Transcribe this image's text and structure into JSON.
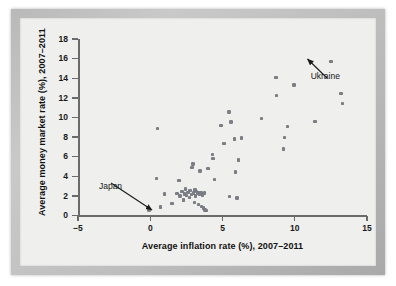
{
  "chart_data": {
    "type": "scatter",
    "title": "",
    "xlabel": "Average inflation rate (%), 2007–2011",
    "ylabel": "Average money market rate (%), 2007–2011",
    "xlim": [
      -5,
      15
    ],
    "ylim": [
      0,
      18
    ],
    "xticks": [
      -5,
      0,
      5,
      10,
      15
    ],
    "xtick_labels": [
      "−5",
      "0",
      "5",
      "10",
      "15"
    ],
    "yticks": [
      0,
      2,
      4,
      6,
      8,
      10,
      12,
      14,
      16,
      18
    ],
    "ytick_labels": [
      "0",
      "2",
      "4",
      "6",
      "8",
      "10",
      "12",
      "14",
      "16",
      "18"
    ],
    "grid": false,
    "legend": null,
    "marker_color": "#7c7f86",
    "axis_color": "#6b6b6b",
    "background_color": "#efefed",
    "points": [
      [
        -0.1,
        0.55
      ],
      [
        0.5,
        8.9
      ],
      [
        0.45,
        3.8
      ],
      [
        0.7,
        0.85
      ],
      [
        1.0,
        2.2
      ],
      [
        1.5,
        1.2
      ],
      [
        2.0,
        3.55
      ],
      [
        1.85,
        2.25
      ],
      [
        2.05,
        2.0
      ],
      [
        2.2,
        2.45
      ],
      [
        2.3,
        1.6
      ],
      [
        2.35,
        2.2
      ],
      [
        2.45,
        2.7
      ],
      [
        2.5,
        2.05
      ],
      [
        2.6,
        2.35
      ],
      [
        2.7,
        1.85
      ],
      [
        2.75,
        2.55
      ],
      [
        2.85,
        2.15
      ],
      [
        2.9,
        4.9
      ],
      [
        2.95,
        5.25
      ],
      [
        3.0,
        2.3
      ],
      [
        3.05,
        1.35
      ],
      [
        3.1,
        2.6
      ],
      [
        3.15,
        2.0
      ],
      [
        3.2,
        2.45
      ],
      [
        3.3,
        2.3
      ],
      [
        3.35,
        1.1
      ],
      [
        3.4,
        2.2
      ],
      [
        3.45,
        4.55
      ],
      [
        3.5,
        2.35
      ],
      [
        3.55,
        0.9
      ],
      [
        3.6,
        2.1
      ],
      [
        3.7,
        0.75
      ],
      [
        3.75,
        2.3
      ],
      [
        3.8,
        0.55
      ],
      [
        3.9,
        0.5
      ],
      [
        4.0,
        4.8
      ],
      [
        4.3,
        6.25
      ],
      [
        4.35,
        5.8
      ],
      [
        4.45,
        3.7
      ],
      [
        4.9,
        9.2
      ],
      [
        5.1,
        7.35
      ],
      [
        5.45,
        10.55
      ],
      [
        5.5,
        1.95
      ],
      [
        5.6,
        9.55
      ],
      [
        5.85,
        7.8
      ],
      [
        5.9,
        4.45
      ],
      [
        6.0,
        1.8
      ],
      [
        6.1,
        5.65
      ],
      [
        6.3,
        7.9
      ],
      [
        7.7,
        9.9
      ],
      [
        8.7,
        14.1
      ],
      [
        8.75,
        12.25
      ],
      [
        9.2,
        6.8
      ],
      [
        9.3,
        7.95
      ],
      [
        9.5,
        9.05
      ],
      [
        9.95,
        13.3
      ],
      [
        11.4,
        9.6
      ],
      [
        12.5,
        15.7
      ],
      [
        13.2,
        12.45
      ],
      [
        13.3,
        11.45
      ]
    ],
    "annotations": [
      {
        "text": "Japan",
        "point": [
          -0.1,
          0.55
        ],
        "label_x": -3.55,
        "label_y": 3.05
      },
      {
        "text": "Ukraine",
        "point": [
          12.5,
          15.7
        ],
        "label_x": 11.1,
        "label_y": 14.2
      }
    ]
  }
}
